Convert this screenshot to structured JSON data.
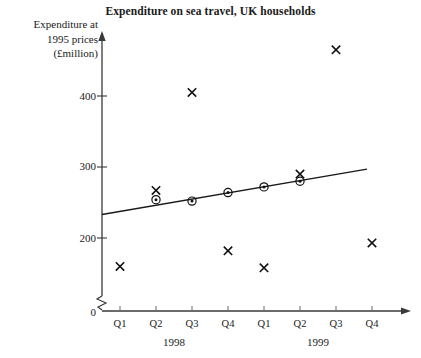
{
  "chart_data": {
    "type": "scatter",
    "title": "Expenditure on sea travel, UK households",
    "ylabel_lines": [
      "Expenditure at",
      "1995 prices",
      "(£million)"
    ],
    "xlabel": "",
    "ylim": [
      0,
      480
    ],
    "y_ticks": [
      0,
      200,
      300,
      400
    ],
    "y_tick_labels": [
      "0",
      "200",
      "300",
      "400"
    ],
    "axis_break": true,
    "grid": false,
    "legend": null,
    "categories": [
      "Q1",
      "Q2",
      "Q3",
      "Q4",
      "Q1",
      "Q2",
      "Q3",
      "Q4"
    ],
    "group_labels": [
      "1998",
      "1999"
    ],
    "series": [
      {
        "name": "Actual expenditure",
        "marker": "cross",
        "values": [
          160,
          267,
          405,
          182,
          158,
          290,
          465,
          193
        ]
      },
      {
        "name": "Moving average (trend)",
        "marker": "circled-dot",
        "values": [
          null,
          254,
          252,
          264,
          272,
          280,
          null,
          null
        ]
      }
    ],
    "trend_line": {
      "name": "Trend line",
      "x_start_quarter": 1,
      "x_end_quarter": 8,
      "y_start": 233,
      "y_end": 297
    }
  },
  "axis": {
    "y_arrow": true,
    "x_arrow": true
  }
}
